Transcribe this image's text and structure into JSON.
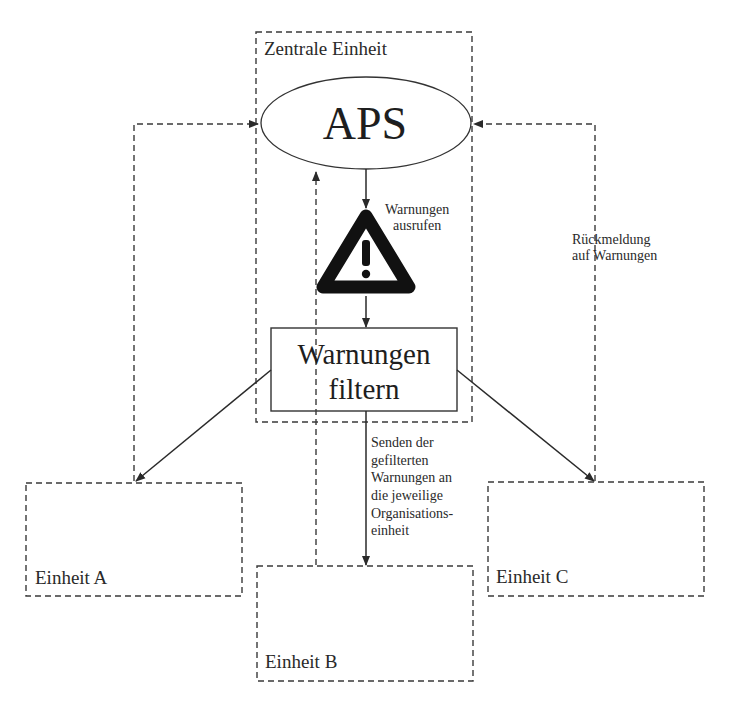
{
  "diagram": {
    "central_unit": {
      "title": "Zentrale Einheit",
      "aps_label": "APS",
      "warning_icon": "warning-triangle-exclamation",
      "call_warnings_label": "Warnungen\nausrufen",
      "filter_label_line1": "Warnungen",
      "filter_label_line2": "filtern"
    },
    "feedback_label_line1": "Rückmeldung",
    "feedback_label_line2": "auf Warnungen",
    "send_label_lines": [
      "Senden der",
      "gefilterten",
      "Warnungen an",
      "die jeweilige",
      "Organisations-",
      "einheit"
    ],
    "units": [
      {
        "label": "Einheit A"
      },
      {
        "label": "Einheit B"
      },
      {
        "label": "Einheit C"
      }
    ],
    "call_label_line1": "Warnungen",
    "call_label_line2": "ausrufen",
    "colors": {
      "line": "#2a2a2a",
      "background": "#ffffff"
    }
  }
}
